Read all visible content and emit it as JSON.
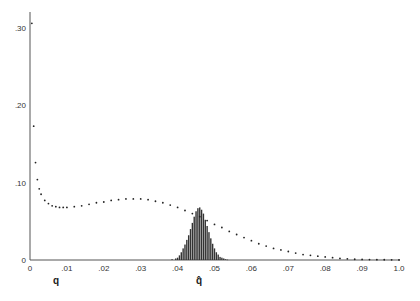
{
  "chart_data": {
    "type": "scatter",
    "title": "",
    "xlabel": "q",
    "xlabel_marker": "q̂",
    "ylabel": "",
    "xlim": [
      0,
      0.1
    ],
    "ylim": [
      0,
      0.32
    ],
    "grid": false,
    "legend": null,
    "x_ticks": [
      "0",
      ".01",
      ".02",
      ".03",
      ".04",
      ".05",
      ".06",
      ".07",
      ".08",
      ".09",
      "1.0"
    ],
    "y_ticks": [
      "0",
      ".10",
      ".20",
      ".30"
    ],
    "series": [
      {
        "name": "likelihood curve (dotted)",
        "type": "dotted-line",
        "x": [
          0.0005,
          0.001,
          0.0015,
          0.002,
          0.0025,
          0.003,
          0.004,
          0.005,
          0.006,
          0.007,
          0.008,
          0.009,
          0.01,
          0.012,
          0.014,
          0.016,
          0.018,
          0.02,
          0.022,
          0.024,
          0.026,
          0.028,
          0.03,
          0.032,
          0.034,
          0.036,
          0.038,
          0.04,
          0.042,
          0.044,
          0.046,
          0.048,
          0.05,
          0.052,
          0.054,
          0.056,
          0.058,
          0.06,
          0.062,
          0.064,
          0.066,
          0.068,
          0.07,
          0.072,
          0.074,
          0.076,
          0.078,
          0.08,
          0.082,
          0.084,
          0.086,
          0.088,
          0.09,
          0.092,
          0.094,
          0.096,
          0.098,
          0.1
        ],
        "y": [
          0.306,
          0.173,
          0.126,
          0.104,
          0.092,
          0.085,
          0.077,
          0.073,
          0.07,
          0.069,
          0.068,
          0.068,
          0.068,
          0.069,
          0.07,
          0.072,
          0.074,
          0.075,
          0.077,
          0.078,
          0.079,
          0.079,
          0.079,
          0.078,
          0.076,
          0.074,
          0.071,
          0.068,
          0.064,
          0.06,
          0.056,
          0.051,
          0.046,
          0.042,
          0.037,
          0.033,
          0.029,
          0.025,
          0.021,
          0.018,
          0.015,
          0.013,
          0.011,
          0.009,
          0.007,
          0.006,
          0.005,
          0.004,
          0.003,
          0.002,
          0.0015,
          0.001,
          0.0008,
          0.0006,
          0.0004,
          0.0003,
          0.0002,
          0.0001
        ]
      },
      {
        "name": "sampling distribution of q̂ (bars)",
        "type": "bar",
        "x": [
          0.0385,
          0.0395,
          0.04,
          0.0405,
          0.041,
          0.0415,
          0.042,
          0.0425,
          0.043,
          0.0435,
          0.044,
          0.0445,
          0.045,
          0.0455,
          0.046,
          0.0465,
          0.047,
          0.0475,
          0.048,
          0.0485,
          0.049,
          0.0495,
          0.05,
          0.0505,
          0.051,
          0.0515,
          0.052,
          0.0525,
          0.053,
          0.0535
        ],
        "y": [
          0.001,
          0.002,
          0.003,
          0.006,
          0.01,
          0.015,
          0.02,
          0.026,
          0.032,
          0.04,
          0.048,
          0.056,
          0.063,
          0.067,
          0.068,
          0.065,
          0.06,
          0.052,
          0.044,
          0.036,
          0.028,
          0.021,
          0.015,
          0.01,
          0.007,
          0.004,
          0.003,
          0.002,
          0.001,
          0.0005
        ]
      }
    ]
  },
  "axes": {
    "x_label": "q",
    "x_marker_label": "q̂"
  }
}
